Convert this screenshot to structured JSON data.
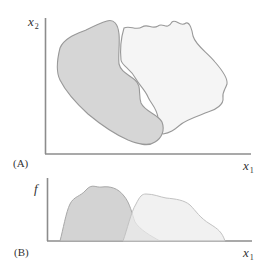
{
  "panel_a": {
    "label": "(A)",
    "y_axis": {
      "var": "x",
      "sub": "2"
    },
    "x_axis": {
      "var": "x",
      "sub": "1"
    },
    "regions": [
      {
        "name": "left-population",
        "fill": "#d6d6d6",
        "stroke": "#9a9a9a"
      },
      {
        "name": "right-population",
        "fill": "#f5f5f5",
        "stroke": "#9a9a9a"
      }
    ]
  },
  "panel_b": {
    "label": "(B)",
    "y_axis": {
      "var": "f"
    },
    "x_axis": {
      "var": "x",
      "sub": "1"
    },
    "distributions": [
      {
        "name": "left-distribution",
        "fill": "#d3d3d3",
        "stroke": "#a8a8a8"
      },
      {
        "name": "right-distribution",
        "fill": "#ececec",
        "stroke": "#c2c2c2",
        "opacity": 0.75
      }
    ]
  },
  "colors": {
    "axis": "#8c8c8c",
    "text": "#333333"
  }
}
